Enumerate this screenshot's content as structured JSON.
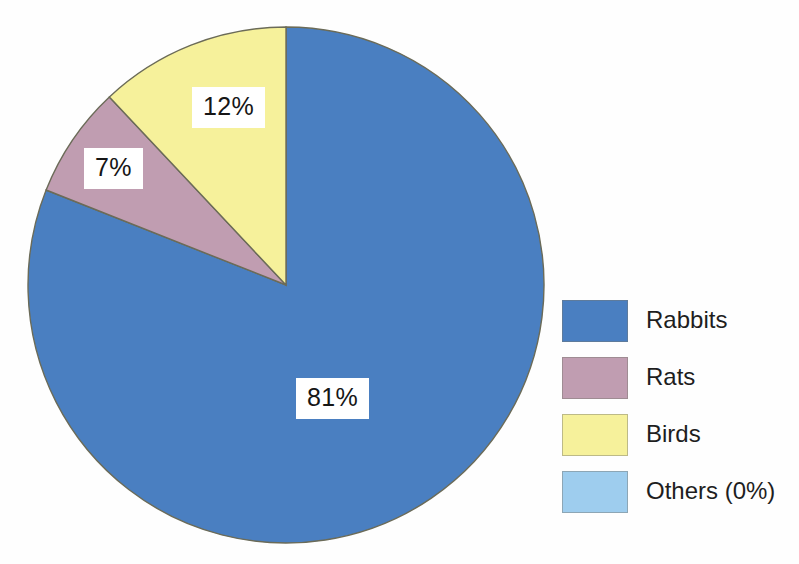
{
  "chart_data": {
    "type": "pie",
    "title": "",
    "subtitle": "",
    "xlabel": "",
    "ylabel": "",
    "categories": [
      "Rabbits",
      "Rats",
      "Birds",
      "Others (0%)"
    ],
    "values": [
      81,
      7,
      12,
      0
    ],
    "value_unit": "%",
    "data_labels": [
      "81%",
      "7%",
      "12%",
      ""
    ],
    "colors": [
      "#4a7fc1",
      "#c09db1",
      "#f6f19b",
      "#9ecdee"
    ],
    "start_angle_deg": 0,
    "direction": "clockwise",
    "legend_position": "right",
    "grid": false,
    "slice_outline_color": "#6b6b58",
    "label_background": "#ffffff"
  },
  "pie": {
    "center_x": 286,
    "center_y": 285,
    "radius": 258,
    "slices": [
      {
        "name": "Rabbits",
        "percent": 81,
        "label": "81%",
        "color": "#4a7fc1"
      },
      {
        "name": "Rats",
        "percent": 7,
        "label": "7%",
        "color": "#c09db1"
      },
      {
        "name": "Birds",
        "percent": 12,
        "label": "12%",
        "color": "#f6f19b"
      },
      {
        "name": "Others (0%)",
        "percent": 0,
        "label": "",
        "color": "#9ecdee"
      }
    ]
  },
  "labels": {
    "rabbits": "81%",
    "rats": "7%",
    "birds": "12%"
  },
  "legend": {
    "items": [
      {
        "label": "Rabbits",
        "color": "#4a7fc1"
      },
      {
        "label": "Rats",
        "color": "#c09db1"
      },
      {
        "label": "Birds",
        "color": "#f6f19b"
      },
      {
        "label": "Others (0%)",
        "color": "#9ecdee"
      }
    ]
  }
}
